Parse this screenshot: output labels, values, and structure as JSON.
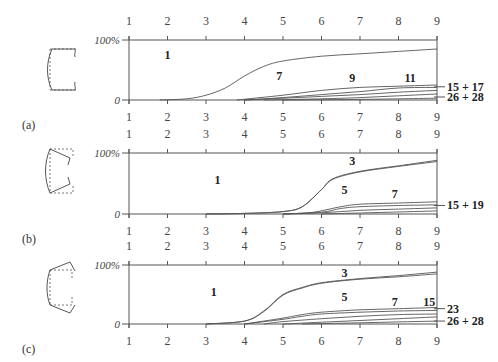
{
  "chart_data": [
    {
      "panel": "(a)",
      "type": "area",
      "x_ticks": [
        "1",
        "2",
        "3",
        "4",
        "5",
        "6",
        "7",
        "8",
        "9"
      ],
      "y_ticks": [
        "0",
        "100%"
      ],
      "ylim": [
        0,
        100
      ],
      "region_labels": [
        {
          "text": "1",
          "x": 2.0,
          "y": 75
        },
        {
          "text": "7",
          "x": 4.9,
          "y": 40
        },
        {
          "text": "9",
          "x": 6.8,
          "y": 36
        },
        {
          "text": "11",
          "x": 8.3,
          "y": 36
        }
      ],
      "right_labels": [
        "15 + 17",
        "26 + 28"
      ],
      "series": [
        {
          "name": "1/7 boundary",
          "x": [
            1.8,
            2.5,
            3,
            3.5,
            4,
            4.5,
            5,
            6,
            7,
            8,
            9
          ],
          "y": [
            0,
            2,
            8,
            20,
            40,
            56,
            65,
            73,
            77,
            81,
            85
          ]
        },
        {
          "name": "7/9 boundary",
          "x": [
            3.8,
            5,
            6,
            7,
            8,
            9
          ],
          "y": [
            0,
            8,
            16,
            21,
            23,
            25
          ]
        },
        {
          "name": "9/11 boundary",
          "x": [
            4,
            5,
            6,
            7,
            8,
            9
          ],
          "y": [
            0,
            4,
            9,
            14,
            20,
            21
          ]
        },
        {
          "name": "11/15 boundary",
          "x": [
            4,
            5,
            6,
            7,
            8,
            9
          ],
          "y": [
            0,
            3,
            6,
            9,
            13,
            16
          ]
        },
        {
          "name": "15+17/26 boundary",
          "x": [
            4.5,
            6,
            7,
            8,
            9
          ],
          "y": [
            0,
            2,
            4,
            7,
            10
          ]
        },
        {
          "name": "26+28 boundary",
          "x": [
            5,
            7,
            9
          ],
          "y": [
            0,
            1,
            3
          ]
        }
      ]
    },
    {
      "panel": "(b)",
      "type": "area",
      "x_ticks": [
        "1",
        "2",
        "3",
        "4",
        "5",
        "6",
        "7",
        "8",
        "9"
      ],
      "y_ticks": [
        "0",
        "100%"
      ],
      "ylim": [
        0,
        100
      ],
      "region_labels": [
        {
          "text": "1",
          "x": 3.3,
          "y": 55
        },
        {
          "text": "3",
          "x": 6.8,
          "y": 87
        },
        {
          "text": "5",
          "x": 6.6,
          "y": 40
        },
        {
          "text": "7",
          "x": 7.9,
          "y": 33
        }
      ],
      "right_labels": [
        "15 + 19"
      ],
      "series": [
        {
          "name": "1/3 boundary",
          "x": [
            3,
            4,
            5,
            5.5,
            6,
            6.3,
            7,
            8,
            9
          ],
          "y": [
            0,
            1,
            4,
            12,
            40,
            58,
            70,
            79,
            88
          ]
        },
        {
          "name": "3/5 boundary",
          "x": [
            3,
            4,
            5,
            5.5,
            6,
            6.3,
            7,
            8,
            9
          ],
          "y": [
            0,
            1,
            4,
            12,
            40,
            57,
            69,
            78,
            86
          ]
        },
        {
          "name": "5/7 boundary",
          "x": [
            5,
            5.8,
            6.5,
            7,
            8,
            9
          ],
          "y": [
            0,
            3,
            12,
            16,
            18,
            20
          ]
        },
        {
          "name": "7/15 boundary",
          "x": [
            5,
            6,
            6.5,
            7,
            8,
            9
          ],
          "y": [
            0,
            3,
            9,
            12,
            14,
            15
          ]
        },
        {
          "name": "15+19 lower",
          "x": [
            5,
            6,
            7,
            8,
            9
          ],
          "y": [
            0,
            2,
            6,
            8,
            10
          ]
        },
        {
          "name": "bottom",
          "x": [
            6,
            9
          ],
          "y": [
            0,
            5
          ]
        }
      ]
    },
    {
      "panel": "(c)",
      "type": "area",
      "x_ticks": [
        "1",
        "2",
        "3",
        "4",
        "5",
        "6",
        "7",
        "8",
        "9"
      ],
      "y_ticks": [
        "0",
        "100%"
      ],
      "ylim": [
        0,
        100
      ],
      "region_labels": [
        {
          "text": "1",
          "x": 3.2,
          "y": 55
        },
        {
          "text": "3",
          "x": 6.6,
          "y": 87
        },
        {
          "text": "5",
          "x": 6.6,
          "y": 46
        },
        {
          "text": "7",
          "x": 7.9,
          "y": 37
        },
        {
          "text": "15",
          "x": 8.8,
          "y": 37
        }
      ],
      "right_labels": [
        "23",
        "26 + 28"
      ],
      "series": [
        {
          "name": "1/3 boundary",
          "x": [
            3,
            4,
            4.5,
            5,
            5.5,
            6,
            7,
            8,
            9
          ],
          "y": [
            0,
            5,
            22,
            50,
            62,
            70,
            77,
            82,
            88
          ]
        },
        {
          "name": "3/5 boundary",
          "x": [
            3,
            4,
            4.5,
            5,
            5.5,
            6,
            7,
            8,
            9
          ],
          "y": [
            0,
            5,
            21,
            49,
            61,
            69,
            76,
            80,
            85
          ]
        },
        {
          "name": "5/7 boundary",
          "x": [
            4,
            5,
            5.5,
            6,
            7,
            8,
            9
          ],
          "y": [
            0,
            10,
            16,
            20,
            24,
            26,
            28
          ]
        },
        {
          "name": "7/15 boundary",
          "x": [
            4,
            5,
            5.5,
            6,
            7,
            8,
            9
          ],
          "y": [
            0,
            8,
            13,
            17,
            20,
            22,
            23
          ]
        },
        {
          "name": "15/23 boundary",
          "x": [
            4.5,
            5,
            6,
            7,
            8,
            9
          ],
          "y": [
            0,
            4,
            9,
            13,
            16,
            17
          ]
        },
        {
          "name": "23/26 boundary",
          "x": [
            5,
            6,
            7,
            8,
            9
          ],
          "y": [
            0,
            3,
            6,
            9,
            12
          ]
        },
        {
          "name": "26+28 boundary",
          "x": [
            5.5,
            7,
            9
          ],
          "y": [
            0,
            2,
            5
          ]
        }
      ]
    }
  ],
  "panels": {
    "a": {
      "label": "(a)",
      "top_pct": "100%",
      "zero": "0",
      "r1": "1",
      "r7": "7",
      "r9": "9",
      "r11": "11",
      "right1": "15 + 17",
      "right2": "26 + 28"
    },
    "b": {
      "label": "(b)",
      "top_pct": "100%",
      "zero": "0",
      "r1": "1",
      "r3": "3",
      "r5": "5",
      "r7": "7",
      "right1": "15 + 19"
    },
    "c": {
      "label": "(c)",
      "top_pct": "100%",
      "zero": "0",
      "r1": "1",
      "r3": "3",
      "r5": "5",
      "r7": "7",
      "r15": "15",
      "right1": "23",
      "right2": "26 + 28"
    }
  },
  "ticks": [
    "1",
    "2",
    "3",
    "4",
    "5",
    "6",
    "7",
    "8",
    "9"
  ]
}
